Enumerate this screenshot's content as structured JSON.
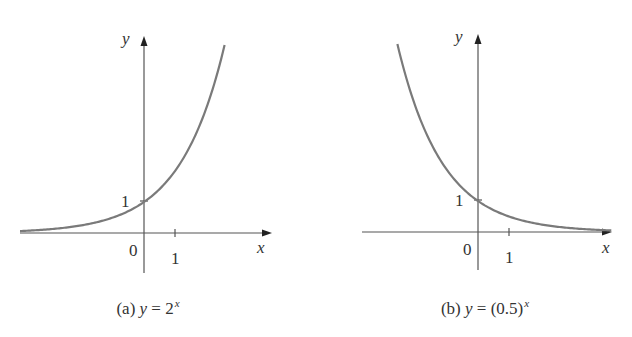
{
  "figure": {
    "panels": [
      {
        "id": "a",
        "caption_prefix": "(a)",
        "caption_var": "y",
        "caption_eq": "=",
        "caption_base": "2",
        "caption_exp": "x",
        "y_axis_label": "y",
        "x_axis_label": "x",
        "origin_label": "0",
        "y_tick_label": "1",
        "x_tick_label": "1"
      },
      {
        "id": "b",
        "caption_prefix": "(b)",
        "caption_var": "y",
        "caption_eq": "=",
        "caption_base": "(0.5)",
        "caption_exp": "x",
        "y_axis_label": "y",
        "x_axis_label": "x",
        "origin_label": "0",
        "y_tick_label": "1",
        "x_tick_label": "1"
      }
    ],
    "colors": {
      "curve": "#7a7a7a",
      "axis": "#555555",
      "text": "#333333"
    }
  },
  "chart_data": [
    {
      "type": "line",
      "title": "(a) y = 2^x",
      "function": "2^x",
      "xlabel": "x",
      "ylabel": "y",
      "x_ticks": [
        0,
        1
      ],
      "y_ticks": [
        1
      ],
      "x": [
        -4,
        -3,
        -2,
        -1,
        0,
        1,
        2,
        2.6
      ],
      "values": [
        0.0625,
        0.125,
        0.25,
        0.5,
        1,
        2,
        4,
        6.06
      ],
      "xlim": [
        -4,
        4
      ],
      "ylim": [
        -1.3,
        6.2
      ],
      "grid": false,
      "annotations": [
        "y-intercept at (0, 1)"
      ]
    },
    {
      "type": "line",
      "title": "(b) y = (0.5)^x",
      "function": "(0.5)^x",
      "xlabel": "x",
      "ylabel": "y",
      "x_ticks": [
        0,
        1
      ],
      "y_ticks": [
        1
      ],
      "x": [
        -2.6,
        -2,
        -1,
        0,
        1,
        2,
        3,
        4
      ],
      "values": [
        6.06,
        4,
        2,
        1,
        0.5,
        0.25,
        0.125,
        0.0625
      ],
      "xlim": [
        -3.7,
        4.3
      ],
      "ylim": [
        -1.2,
        6.3
      ],
      "grid": false,
      "annotations": [
        "y-intercept at (0, 1)"
      ]
    }
  ]
}
